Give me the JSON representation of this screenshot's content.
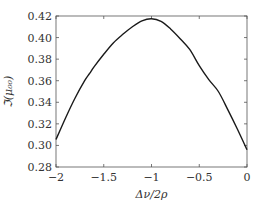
{
  "chart_data": {
    "type": "line",
    "title": "",
    "xlabel": "Δν/2ρ",
    "ylabel": "ℑ(μ₀₀)",
    "xlim": [
      -2,
      0
    ],
    "ylim": [
      0.28,
      0.42
    ],
    "grid": false,
    "legend": null,
    "xticks": [
      -2,
      -1.5,
      -1,
      -0.5,
      0
    ],
    "xtick_labels": [
      "−2",
      "−1.5",
      "−1",
      "−0.5",
      "0"
    ],
    "yticks": [
      0.28,
      0.3,
      0.32,
      0.34,
      0.36,
      0.38,
      0.4,
      0.42
    ],
    "ytick_labels": [
      "0.28",
      "0.30",
      "0.32",
      "0.34",
      "0.36",
      "0.38",
      "0.40",
      "0.42"
    ],
    "series": [
      {
        "name": "ℑ(μ₀₀)",
        "color": "#1a1a1a",
        "x": [
          -2.0,
          -1.9,
          -1.8,
          -1.7,
          -1.65,
          -1.6,
          -1.5,
          -1.4,
          -1.3,
          -1.2,
          -1.1,
          -1.0,
          -0.9,
          -0.8,
          -0.7,
          -0.6,
          -0.5,
          -0.4,
          -0.3,
          -0.2,
          -0.1,
          0.0
        ],
        "y": [
          0.3055,
          0.3255,
          0.344,
          0.36,
          0.3665,
          0.373,
          0.3845,
          0.395,
          0.403,
          0.41,
          0.4155,
          0.4175,
          0.415,
          0.408,
          0.399,
          0.389,
          0.374,
          0.361,
          0.35,
          0.333,
          0.315,
          0.296
        ]
      }
    ]
  }
}
